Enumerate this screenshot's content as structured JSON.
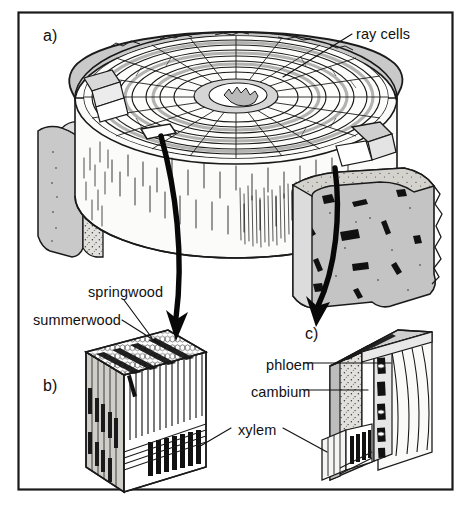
{
  "figure": {
    "border_color": "#1a1a1a",
    "background": "#ffffff",
    "ink_color": "#111111",
    "fill_light_gray": "#cfcfcf",
    "fill_mid_gray": "#b8b8b8",
    "fill_pale": "#e8e8e6"
  },
  "panels": [
    {
      "id": "a",
      "letter": "a)",
      "caption": "Three-dimensional cut log showing bark, sapwood and growth rings"
    },
    {
      "id": "b",
      "letter": "b)",
      "caption": "Magnified block of xylem showing springwood and summerwood"
    },
    {
      "id": "c",
      "letter": "c)",
      "caption": "Magnified block showing phloem, cambium and xylem"
    }
  ],
  "labels": {
    "ray_cells": "ray cells",
    "springwood": "springwood",
    "summerwood": "summerwood",
    "phloem": "phloem",
    "cambium": "cambium",
    "xylem": "xylem"
  },
  "arrows": [
    {
      "name": "arrow-a-to-b",
      "from_panel": "a",
      "to_panel": "b"
    },
    {
      "name": "arrow-a-to-c",
      "from_panel": "a",
      "to_panel": "c"
    }
  ],
  "leader_lines": [
    {
      "name": "leader-ray-cells",
      "label": "ray cells"
    },
    {
      "name": "leader-springwood",
      "label": "springwood"
    },
    {
      "name": "leader-summerwood",
      "label": "summerwood"
    },
    {
      "name": "leader-phloem",
      "label": "phloem"
    },
    {
      "name": "leader-cambium",
      "label": "cambium"
    },
    {
      "name": "leader-xylem-left",
      "label": "xylem"
    },
    {
      "name": "leader-xylem-right",
      "label": "xylem"
    }
  ]
}
